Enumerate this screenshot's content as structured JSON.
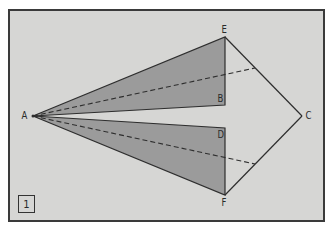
{
  "figure": {
    "number_label": "1",
    "colors": {
      "background": "#d6d6d4",
      "frame": "#3a3a3a",
      "shading": "#9b9b9b",
      "line": "#2e2e2e"
    }
  },
  "points": {
    "A": {
      "label": "A",
      "x": 33,
      "y": 116
    },
    "B": {
      "label": "B",
      "x": 225,
      "y": 105
    },
    "C": {
      "label": "C",
      "x": 302,
      "y": 116
    },
    "D": {
      "label": "D",
      "x": 225,
      "y": 128
    },
    "E": {
      "label": "E",
      "x": 225,
      "y": 37
    },
    "F": {
      "label": "F",
      "x": 225,
      "y": 195
    }
  },
  "shapes": {
    "upper_triangle": "AEB (shaded)",
    "lower_triangle": "ADF (shaded)",
    "kite_edges": [
      "EC",
      "FC"
    ],
    "dashed_lines": [
      {
        "from": "A",
        "to_point_on": "EC",
        "x": 255,
        "y": 68
      },
      {
        "from": "A",
        "to_point_on": "FC",
        "x": 255,
        "y": 164
      }
    ]
  }
}
